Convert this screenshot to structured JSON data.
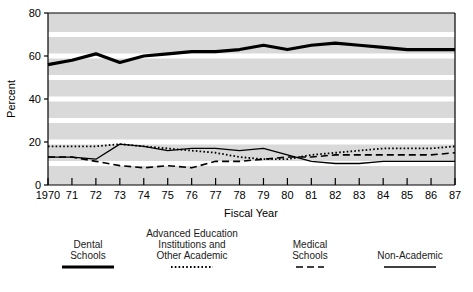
{
  "chart_data": {
    "type": "line",
    "title": "",
    "xlabel": "Fiscal Year",
    "ylabel": "Percent",
    "xlim": [
      1970,
      1987
    ],
    "ylim": [
      0,
      80
    ],
    "yticks": [
      0,
      20,
      40,
      60,
      80
    ],
    "ytick_labels": [
      "0",
      "20",
      "40",
      "60",
      "80"
    ],
    "grid": "horizontal white gridlines every 10 units on light gray panel",
    "legend_position": "below plot, four entries in a row",
    "x": [
      1970,
      1971,
      1972,
      1973,
      1974,
      1975,
      1976,
      1977,
      1978,
      1979,
      1980,
      1981,
      1982,
      1983,
      1984,
      1985,
      1986,
      1987
    ],
    "xtick_labels": [
      "1970",
      "71",
      "72",
      "73",
      "74",
      "75",
      "76",
      "77",
      "78",
      "79",
      "80",
      "81",
      "82",
      "83",
      "84",
      "85",
      "86",
      "87"
    ],
    "series": [
      {
        "name": "Dental Schools",
        "style": "solid-thick",
        "color": "#000000",
        "values": [
          56,
          58,
          61,
          57,
          60,
          61,
          62,
          62,
          63,
          65,
          63,
          65,
          66,
          65,
          64,
          63,
          63,
          63
        ]
      },
      {
        "name": "Advanced Education Institutions and Other Academic",
        "style": "dotted",
        "color": "#000000",
        "values": [
          18,
          18,
          18,
          19,
          18,
          17,
          16,
          15,
          13,
          12,
          12,
          14,
          15,
          16,
          17,
          17,
          17,
          18
        ]
      },
      {
        "name": "Medical Schools",
        "style": "dashed",
        "color": "#000000",
        "values": [
          13,
          13,
          11,
          9,
          8,
          9,
          8,
          11,
          11,
          12,
          13,
          13,
          14,
          14,
          14,
          14,
          14,
          15
        ]
      },
      {
        "name": "Non-Academic",
        "style": "solid-thin",
        "color": "#000000",
        "values": [
          13,
          13,
          12,
          19,
          18,
          16,
          17,
          17,
          16,
          17,
          14,
          11,
          10,
          10,
          11,
          11,
          11,
          11
        ]
      }
    ]
  },
  "axes": {
    "ylabel": "Percent",
    "xlabel": "Fiscal Year"
  },
  "legend": {
    "entries": [
      {
        "lines": [
          "Dental",
          "Schools"
        ],
        "swatch": "solid-thick-swatch"
      },
      {
        "lines": [
          "Advanced Education",
          "Institutions and",
          "Other Academic"
        ],
        "swatch": "dotted-swatch"
      },
      {
        "lines": [
          "Medical",
          "Schools"
        ],
        "swatch": "dashed-swatch"
      },
      {
        "lines": [
          "Non-Academic"
        ],
        "swatch": "solid-thin-swatch"
      }
    ]
  },
  "colors": {
    "panel": "#d9d9d9",
    "gridline": "#ffffff",
    "ink": "#000000",
    "page": "#ffffff"
  }
}
